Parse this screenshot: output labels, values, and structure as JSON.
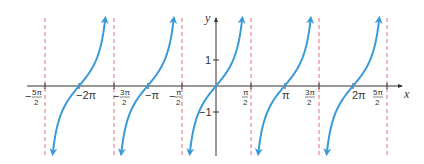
{
  "chart_data": {
    "type": "line",
    "title": "",
    "function": "y = tan(x)",
    "xlabel": "x",
    "ylabel": "y",
    "xlim": [
      -8.6,
      9.3
    ],
    "ylim": [
      -2.8,
      2.6
    ],
    "grid": false,
    "legend": null,
    "x_ticks": [
      {
        "value": -7.854,
        "label": "-5π/2",
        "num": "5π",
        "den": "2",
        "neg": true
      },
      {
        "value": -6.283,
        "label": "-2π"
      },
      {
        "value": -4.712,
        "label": "-3π/2",
        "num": "3π",
        "den": "2",
        "neg": true
      },
      {
        "value": -3.1416,
        "label": "-π"
      },
      {
        "value": -1.5708,
        "label": "-π/2",
        "num": "π",
        "den": "2",
        "neg": true
      },
      {
        "value": 1.5708,
        "label": "π/2",
        "num": "π",
        "den": "2",
        "neg": false
      },
      {
        "value": 3.1416,
        "label": "π"
      },
      {
        "value": 4.712,
        "label": "3π/2",
        "num": "3π",
        "den": "2",
        "neg": false
      },
      {
        "value": 6.283,
        "label": "2π"
      },
      {
        "value": 7.854,
        "label": "5π/2",
        "num": "5π",
        "den": "2",
        "neg": false
      }
    ],
    "y_ticks": [
      {
        "value": 1,
        "label": "1"
      },
      {
        "value": -1,
        "label": "−1"
      }
    ],
    "asymptotes": [
      -7.854,
      -4.712,
      -1.5708,
      1.5708,
      4.712,
      7.854
    ],
    "series": [
      {
        "name": "tan x branch 1",
        "x_range": [
          -7.854,
          -4.712
        ],
        "zero": -6.283
      },
      {
        "name": "tan x branch 2",
        "x_range": [
          -4.712,
          -1.5708
        ],
        "zero": -3.1416
      },
      {
        "name": "tan x branch 3",
        "x_range": [
          -1.5708,
          1.5708
        ],
        "zero": 0
      },
      {
        "name": "tan x branch 4",
        "x_range": [
          1.5708,
          4.712
        ],
        "zero": 3.1416
      },
      {
        "name": "tan x branch 5",
        "x_range": [
          4.712,
          7.854
        ],
        "zero": 6.283
      }
    ],
    "colors": {
      "curve": "#3a9ad9",
      "asymptote": "#e0707a",
      "axis": "#333333"
    }
  },
  "labels": {
    "x_axis": "x",
    "y_axis": "y",
    "minus_two_pi": "−2π",
    "minus_pi": "−π",
    "pi": "π",
    "two_pi": "2π",
    "one": "1",
    "minus_one": "−1",
    "minus_sign": "−",
    "neg52_num": "5π",
    "neg52_den": "2",
    "neg32_num": "3π",
    "neg32_den": "2",
    "neg12_num": "π",
    "neg12_den": "2",
    "pos12_num": "π",
    "pos12_den": "2",
    "pos32_num": "3π",
    "pos32_den": "2",
    "pos52_num": "5π",
    "pos52_den": "2"
  }
}
